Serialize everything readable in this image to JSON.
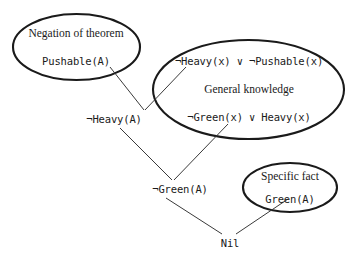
{
  "figure": {
    "type": "resolution-refutation-proof-tree",
    "background_color": "#ffffff",
    "ink_color": "#1a1a1a"
  },
  "groups": [
    {
      "id": "negation-of-theorem",
      "caption": "Negation of theorem",
      "clauses": [
        "Pushable(A)"
      ]
    },
    {
      "id": "general-knowledge",
      "caption": "General knowledge",
      "clauses": [
        "¬Heavy(x) ∨ ¬Pushable(x)",
        "¬Green(x) ∨ Heavy(x)"
      ]
    },
    {
      "id": "specific-fact",
      "caption": "Specific fact",
      "clauses": [
        "Green(A)"
      ]
    }
  ],
  "nodes": {
    "pushable_a": "Pushable(A)",
    "clause_heavy_pushable": "¬Heavy(x) ∨ ¬Pushable(x)",
    "general_knowledge_label": "General knowledge",
    "clause_green_heavy": "¬Green(x) ∨ Heavy(x)",
    "negation_label": "Negation of theorem",
    "specific_fact_label": "Specific fact",
    "green_a": "Green(A)",
    "not_heavy_a": "¬Heavy(A)",
    "not_green_a": "¬Green(A)",
    "nil": "Nil"
  },
  "resolution_steps": [
    {
      "parents": [
        "Pushable(A)",
        "¬Heavy(x) ∨ ¬Pushable(x)"
      ],
      "resolvent": "¬Heavy(A)"
    },
    {
      "parents": [
        "¬Heavy(A)",
        "¬Green(x) ∨ Heavy(x)"
      ],
      "resolvent": "¬Green(A)"
    },
    {
      "parents": [
        "¬Green(A)",
        "Green(A)"
      ],
      "resolvent": "Nil"
    }
  ]
}
